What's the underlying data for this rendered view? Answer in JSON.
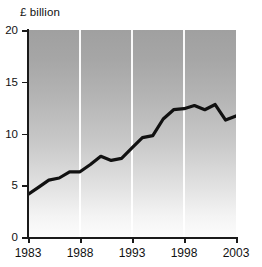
{
  "chart_data": {
    "type": "line",
    "title": "",
    "subtitle": "",
    "ylabel": "£ billion",
    "xlabel": "",
    "ylim": [
      0,
      20
    ],
    "xlim": [
      1983,
      2003
    ],
    "yticks": [
      0,
      5,
      10,
      15,
      20
    ],
    "ytick_labels": [
      "0",
      "5",
      "10",
      "15",
      "20"
    ],
    "xticks": [
      1983,
      1988,
      1993,
      1998,
      2003
    ],
    "xtick_labels": [
      "1983",
      "1988",
      "1993",
      "1998",
      "2003"
    ],
    "grid": "vertical-white-at-xticks",
    "legend": "none",
    "annotations": [],
    "series": [
      {
        "name": "£ billion",
        "x": [
          1983,
          1984,
          1985,
          1986,
          1987,
          1988,
          1989,
          1990,
          1991,
          1992,
          1993,
          1994,
          1995,
          1996,
          1997,
          1998,
          1999,
          2000,
          2001,
          2002,
          2003
        ],
        "values": [
          4.1,
          4.8,
          5.5,
          5.7,
          6.3,
          6.3,
          7.0,
          7.8,
          7.4,
          7.6,
          8.6,
          9.6,
          9.8,
          11.4,
          12.3,
          12.4,
          12.7,
          12.3,
          12.8,
          11.3,
          11.7
        ]
      }
    ]
  },
  "style": {
    "line_color": "#111111",
    "axis_color": "#1a1a1a",
    "gridline_color": "#ffffff",
    "plot_bg_top": "#a0a0a0",
    "plot_bg_bottom": "#fcfcfc",
    "text_color": "#111111"
  }
}
